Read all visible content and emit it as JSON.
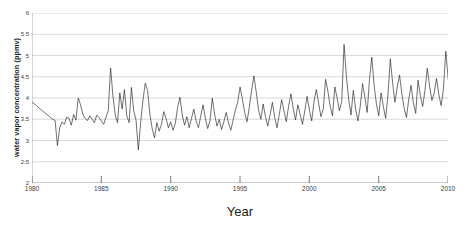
{
  "chart_data": {
    "type": "line",
    "title": "",
    "xlabel": "Year",
    "ylabel": "water vapor concentration (ppmv)",
    "xlim": [
      1980,
      2010
    ],
    "ylim": [
      2,
      6
    ],
    "yticks": [
      2,
      2.5,
      3,
      3.5,
      4,
      4.5,
      5,
      5.5,
      6
    ],
    "ytick_labels": [
      "2",
      "2.5",
      "3",
      "3.5",
      "4",
      "4.5",
      "5",
      "5.5",
      "6"
    ],
    "xticks": [
      1980,
      1985,
      1990,
      1995,
      2000,
      2005,
      2010
    ],
    "xtick_labels": [
      "1980",
      "1985",
      "1990",
      "1995",
      "2000",
      "2005",
      "2010"
    ],
    "grid": "horizontal",
    "legend": "none",
    "line_color": "#222222",
    "grid_color": "#c8c8c8",
    "axis_color": "#9a9a9a",
    "series": [
      {
        "name": "water vapor concentration",
        "x_start": 1980.0,
        "x_step": 0.1667,
        "values": [
          3.9,
          3.86,
          3.82,
          3.77,
          3.72,
          3.68,
          3.63,
          3.59,
          3.54,
          3.5,
          3.47,
          2.88,
          3.3,
          3.44,
          3.38,
          3.55,
          3.52,
          3.36,
          3.61,
          3.48,
          4.0,
          3.84,
          3.62,
          3.52,
          3.47,
          3.58,
          3.5,
          3.42,
          3.6,
          3.54,
          3.46,
          3.38,
          3.55,
          3.7,
          4.71,
          4.05,
          3.6,
          3.42,
          4.12,
          3.74,
          4.2,
          3.58,
          3.42,
          4.25,
          3.7,
          3.48,
          2.78,
          3.42,
          3.95,
          4.35,
          4.18,
          3.62,
          3.28,
          3.06,
          3.42,
          3.22,
          3.38,
          3.68,
          3.52,
          3.3,
          3.44,
          3.24,
          3.4,
          3.78,
          4.02,
          3.6,
          3.36,
          3.56,
          3.3,
          3.52,
          3.74,
          3.46,
          3.3,
          3.58,
          3.84,
          3.52,
          3.28,
          3.46,
          4.0,
          3.62,
          3.34,
          3.5,
          3.26,
          3.44,
          3.66,
          3.42,
          3.24,
          3.48,
          3.72,
          3.9,
          4.26,
          3.98,
          3.66,
          3.44,
          3.78,
          4.18,
          4.52,
          4.14,
          3.72,
          3.5,
          3.86,
          3.56,
          3.34,
          3.6,
          3.9,
          3.54,
          3.3,
          3.62,
          3.96,
          3.7,
          3.44,
          3.8,
          4.1,
          3.76,
          3.48,
          3.84,
          3.62,
          3.38,
          3.7,
          4.04,
          3.72,
          3.46,
          3.92,
          4.2,
          3.88,
          3.56,
          3.74,
          4.44,
          4.16,
          3.8,
          3.58,
          4.26,
          4.0,
          3.7,
          3.92,
          5.26,
          4.52,
          3.96,
          3.6,
          4.18,
          3.74,
          3.46,
          3.8,
          4.34,
          4.02,
          3.66,
          4.44,
          4.96,
          4.3,
          3.86,
          3.58,
          4.12,
          3.8,
          3.52,
          4.08,
          4.92,
          4.36,
          3.9,
          4.26,
          4.54,
          4.1,
          3.76,
          3.54,
          3.98,
          4.3,
          3.88,
          3.64,
          4.42,
          4.06,
          3.8,
          4.18,
          4.7,
          4.28,
          3.94,
          4.12,
          4.46,
          4.08,
          3.82,
          4.22,
          5.1,
          4.48,
          4.02,
          3.78,
          4.32,
          4.6,
          4.16,
          3.88,
          4.4,
          5.32,
          4.86,
          4.34,
          3.96,
          4.52,
          4.2,
          3.9,
          4.36,
          5.04,
          4.58,
          4.12,
          4.4,
          4.72,
          4.24,
          3.94,
          4.46,
          5.56,
          4.9,
          4.38,
          4.66,
          4.86,
          4.42,
          4.1,
          4.34,
          4.08,
          3.86,
          4.24,
          4.48,
          4.16,
          3.9,
          4.32,
          4.04,
          3.78,
          4.1,
          3.86,
          3.62,
          3.96,
          4.2,
          3.88,
          3.56,
          4.02,
          4.26,
          3.94,
          3.62,
          3.38,
          3.8,
          4.06,
          3.7,
          3.44,
          3.84,
          4.74,
          4.32,
          3.96,
          4.18,
          4.44,
          4.06,
          3.74,
          4.22,
          3.92,
          3.6,
          3.34,
          3.76,
          4.1,
          3.8,
          3.52,
          3.9,
          4.26,
          3.94,
          3.66,
          4.02,
          4.74,
          4.36,
          3.98,
          3.7,
          3.46,
          3.2,
          3.62,
          3.94,
          3.6,
          3.32,
          3.74,
          4.06,
          3.78,
          3.48,
          3.24,
          3.66,
          4.0,
          3.72,
          3.42,
          3.86,
          4.18,
          3.92,
          3.64,
          3.4,
          4.3,
          4.52,
          4.12,
          3.8,
          4.08,
          5.38,
          4.72,
          4.2,
          3.86,
          3.52,
          3.2,
          2.64,
          3.46,
          3.88,
          4.16,
          3.9,
          4.32,
          4.04,
          3.72,
          4.26,
          3.94,
          3.66,
          4.1,
          4.36,
          4.02,
          3.7,
          3.92,
          4.24,
          3.88,
          4.06
        ]
      }
    ]
  }
}
